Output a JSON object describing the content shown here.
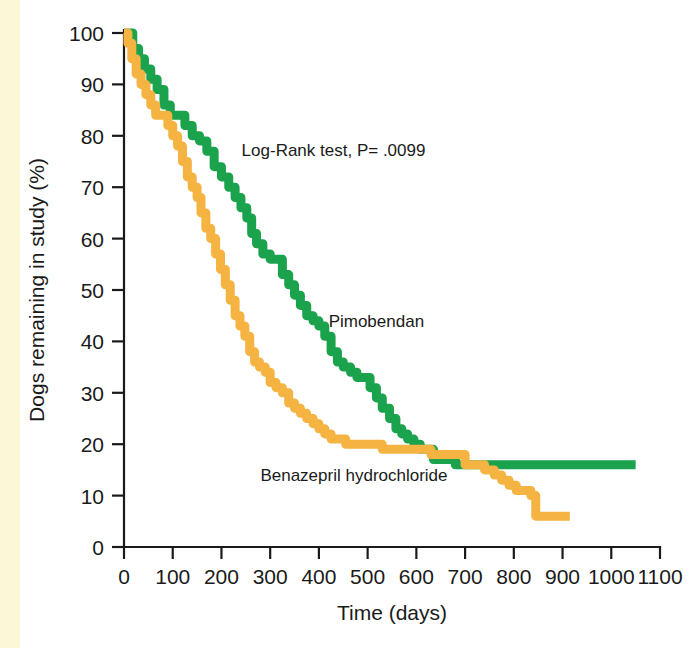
{
  "figure": {
    "background_color": "#ffffff",
    "left_strip_color": "#faf8d6"
  },
  "chart_data": {
    "type": "line",
    "subtype": "kaplan-meier-survival",
    "title": "",
    "xlabel": "Time (days)",
    "ylabel": "Dogs remaining in study (%)",
    "xlim": [
      0,
      1100
    ],
    "ylim": [
      0,
      100
    ],
    "xticks": [
      0,
      100,
      200,
      300,
      400,
      500,
      600,
      700,
      800,
      900,
      1000,
      1100
    ],
    "xtick_labels": [
      "0",
      "100",
      "200",
      "300",
      "400",
      "500",
      "600",
      "700",
      "800",
      "900",
      "1000",
      "1100"
    ],
    "yticks": [
      0,
      10,
      20,
      30,
      40,
      50,
      60,
      70,
      80,
      90,
      100
    ],
    "ytick_labels": [
      "0",
      "10",
      "20",
      "30",
      "40",
      "50",
      "60",
      "70",
      "80",
      "90",
      "100"
    ],
    "grid": false,
    "legend_position": "inline-annotation",
    "annotations": [
      {
        "name": "log-rank-test",
        "text": "Log-Rank test, P= .0099",
        "x": 430,
        "y": 76
      }
    ],
    "series": [
      {
        "name": "Pimobendan",
        "color": "#1ba24c",
        "label_x": 420,
        "label_y": 44,
        "points": [
          [
            0,
            100
          ],
          [
            10,
            100
          ],
          [
            18,
            97
          ],
          [
            30,
            95
          ],
          [
            42,
            93
          ],
          [
            55,
            91
          ],
          [
            68,
            89
          ],
          [
            82,
            86
          ],
          [
            95,
            84
          ],
          [
            110,
            84
          ],
          [
            125,
            82
          ],
          [
            140,
            80
          ],
          [
            155,
            79
          ],
          [
            170,
            77
          ],
          [
            185,
            74
          ],
          [
            200,
            72
          ],
          [
            215,
            70
          ],
          [
            228,
            68
          ],
          [
            240,
            66
          ],
          [
            252,
            64
          ],
          [
            262,
            61
          ],
          [
            272,
            59
          ],
          [
            285,
            57
          ],
          [
            300,
            56
          ],
          [
            315,
            56
          ],
          [
            325,
            53
          ],
          [
            338,
            51
          ],
          [
            350,
            49
          ],
          [
            362,
            47
          ],
          [
            375,
            45
          ],
          [
            388,
            44
          ],
          [
            400,
            43
          ],
          [
            412,
            41
          ],
          [
            425,
            38
          ],
          [
            438,
            36
          ],
          [
            450,
            35
          ],
          [
            465,
            34
          ],
          [
            478,
            33
          ],
          [
            492,
            33
          ],
          [
            505,
            31
          ],
          [
            518,
            29
          ],
          [
            530,
            27
          ],
          [
            545,
            25
          ],
          [
            558,
            23
          ],
          [
            570,
            22
          ],
          [
            582,
            21
          ],
          [
            595,
            20
          ],
          [
            608,
            19
          ],
          [
            620,
            19
          ],
          [
            635,
            17
          ],
          [
            650,
            17
          ],
          [
            680,
            16
          ],
          [
            720,
            16
          ],
          [
            800,
            16
          ],
          [
            900,
            16
          ],
          [
            1000,
            16
          ],
          [
            1050,
            16
          ]
        ]
      },
      {
        "name": "Benazepril hydrochloride",
        "color": "#f5b342",
        "label_x": 280,
        "label_y": 14,
        "points": [
          [
            0,
            100
          ],
          [
            8,
            98
          ],
          [
            16,
            95
          ],
          [
            25,
            92
          ],
          [
            35,
            90
          ],
          [
            45,
            88
          ],
          [
            55,
            86
          ],
          [
            65,
            84
          ],
          [
            78,
            84
          ],
          [
            90,
            82
          ],
          [
            100,
            80
          ],
          [
            110,
            78
          ],
          [
            120,
            75
          ],
          [
            130,
            72
          ],
          [
            140,
            70
          ],
          [
            150,
            68
          ],
          [
            158,
            65
          ],
          [
            168,
            62
          ],
          [
            178,
            60
          ],
          [
            188,
            57
          ],
          [
            198,
            54
          ],
          [
            208,
            51
          ],
          [
            218,
            48
          ],
          [
            228,
            45
          ],
          [
            238,
            43
          ],
          [
            248,
            41
          ],
          [
            258,
            38
          ],
          [
            268,
            36
          ],
          [
            278,
            35
          ],
          [
            290,
            34
          ],
          [
            300,
            32
          ],
          [
            312,
            31
          ],
          [
            325,
            30
          ],
          [
            338,
            28
          ],
          [
            350,
            27
          ],
          [
            362,
            26
          ],
          [
            375,
            25
          ],
          [
            388,
            24
          ],
          [
            400,
            23
          ],
          [
            412,
            22
          ],
          [
            425,
            21
          ],
          [
            440,
            21
          ],
          [
            455,
            20
          ],
          [
            470,
            20
          ],
          [
            490,
            20
          ],
          [
            510,
            20
          ],
          [
            530,
            19
          ],
          [
            550,
            19
          ],
          [
            570,
            19
          ],
          [
            590,
            19
          ],
          [
            610,
            19
          ],
          [
            630,
            18
          ],
          [
            650,
            18
          ],
          [
            665,
            18
          ],
          [
            680,
            18
          ],
          [
            700,
            16
          ],
          [
            720,
            16
          ],
          [
            740,
            15
          ],
          [
            760,
            14
          ],
          [
            775,
            13
          ],
          [
            790,
            12
          ],
          [
            805,
            11
          ],
          [
            820,
            11
          ],
          [
            835,
            10
          ],
          [
            845,
            6
          ],
          [
            860,
            6
          ],
          [
            880,
            6
          ],
          [
            900,
            6
          ],
          [
            915,
            6
          ]
        ]
      }
    ]
  }
}
